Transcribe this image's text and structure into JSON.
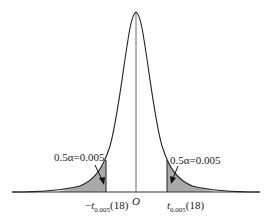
{
  "figure": {
    "type": "t-distribution density with two-tailed rejection regions",
    "origin_label": "O",
    "left_tail": {
      "annotation": "0.5α=0.005",
      "critical_value_sign": "−",
      "critical_value_symbol": "t",
      "critical_value_subscript": "0.005",
      "critical_value_df": "(18)"
    },
    "right_tail": {
      "annotation": "0.5α=0.005",
      "critical_value_sign": "",
      "critical_value_symbol": "t",
      "critical_value_subscript": "0.005",
      "critical_value_df": "(18)"
    },
    "colors": {
      "curve": "#222222",
      "shade": "#a9a9a9",
      "axis": "#333333"
    }
  }
}
